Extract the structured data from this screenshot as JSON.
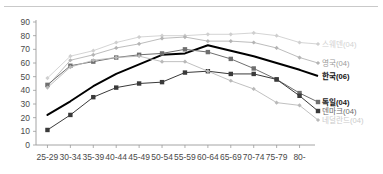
{
  "chart_data": {
    "type": "line",
    "title": "",
    "subtitle": "",
    "xlabel": "",
    "ylabel": "",
    "ylim": [
      0,
      90
    ],
    "yticks": [
      0,
      10,
      20,
      30,
      40,
      50,
      60,
      70,
      80,
      90
    ],
    "grid": false,
    "legend_position": "right-inline",
    "categories": [
      "25-29",
      "30-34",
      "35-39",
      "40-44",
      "45-49",
      "50-54",
      "55-59",
      "60-64",
      "65-69",
      "70-74",
      "75-79",
      "80-"
    ],
    "series": [
      {
        "name": "스웨덴(04)",
        "color": "#cfcfcf",
        "marker": "diamond",
        "width": 0.9,
        "label_color": "#d2d2d2",
        "values": [
          49,
          65,
          69,
          75,
          79,
          80,
          80,
          81,
          81,
          82,
          80,
          75
        ]
      },
      {
        "name": "영국(04)",
        "color": "#b4b4b4",
        "marker": "diamond",
        "width": 0.9,
        "label_color": "#9a9a9a",
        "values": [
          43,
          62,
          66,
          71,
          74,
          78,
          79,
          76,
          76,
          75,
          71,
          64
        ]
      },
      {
        "name": "한국(06)",
        "color": "#000000",
        "marker": "none",
        "width": 2.0,
        "label_color": "#111111",
        "values": [
          22,
          32,
          43,
          52,
          59,
          66,
          67,
          73,
          69,
          65,
          60,
          55
        ]
      },
      {
        "name": "독일(04)",
        "color": "#6f6f6f",
        "marker": "square",
        "width": 1.0,
        "label_color": "#1a1a1a",
        "values": [
          44,
          58,
          61,
          64,
          66,
          67,
          70,
          68,
          63,
          56,
          48,
          38
        ]
      },
      {
        "name": "덴마크(04)",
        "color": "#3a3a3a",
        "marker": "square",
        "width": 1.0,
        "label_color": "#6a6a6a",
        "values": [
          11,
          22,
          35,
          42,
          45,
          46,
          53,
          54,
          52,
          52,
          48,
          36
        ]
      },
      {
        "name": "네덜란드(04)",
        "color": "#b9b9b9",
        "marker": "diamond",
        "width": 0.9,
        "label_color": "#cacaca",
        "values": [
          42,
          57,
          62,
          64,
          65,
          61,
          61,
          54,
          47,
          41,
          31,
          29
        ]
      }
    ]
  },
  "legend": [
    {
      "label": "스웨덴(04)"
    },
    {
      "label": "영국(04)"
    },
    {
      "label": "한국(06)"
    },
    {
      "label": "독일(04)"
    },
    {
      "label": "덴마크(04)"
    },
    {
      "label": "네덜란드(04)"
    }
  ],
  "colors": {
    "axis": "#9a9a9a",
    "tick_text": "#4a4a4a",
    "background": "#ffffff",
    "rule": "#c9c9c9"
  }
}
